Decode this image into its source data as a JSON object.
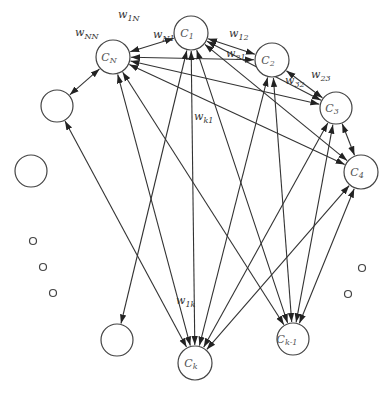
{
  "diagram": {
    "nodes": [
      {
        "id": "C1",
        "label": "C",
        "sub": "1",
        "x": 191,
        "y": 33,
        "r": 17
      },
      {
        "id": "C2",
        "label": "C",
        "sub": "2",
        "x": 272,
        "y": 60,
        "r": 17
      },
      {
        "id": "C3",
        "label": "C",
        "sub": "3",
        "x": 336,
        "y": 108,
        "r": 16
      },
      {
        "id": "C4",
        "label": "C",
        "sub": "4",
        "x": 361,
        "y": 172,
        "r": 17
      },
      {
        "id": "CN",
        "label": "C",
        "sub": "N",
        "x": 113,
        "y": 57,
        "r": 17
      },
      {
        "id": "U1",
        "label": "",
        "sub": "",
        "x": 57,
        "y": 106,
        "r": 16
      },
      {
        "id": "U2",
        "label": "",
        "sub": "",
        "x": 31,
        "y": 171,
        "r": 16
      },
      {
        "id": "U3",
        "label": "",
        "sub": "",
        "x": 117,
        "y": 340,
        "r": 16
      },
      {
        "id": "Ck",
        "label": "C",
        "sub": "k",
        "x": 195,
        "y": 363,
        "r": 17
      },
      {
        "id": "Ck-1",
        "label": "C",
        "sub": "k-1",
        "x": 293,
        "y": 339,
        "r": 16
      }
    ],
    "dots": [
      {
        "x": 33,
        "y": 241,
        "r": 3.5
      },
      {
        "x": 43,
        "y": 267,
        "r": 3.5
      },
      {
        "x": 53,
        "y": 293,
        "r": 3.5
      },
      {
        "x": 362,
        "y": 268,
        "r": 3.5
      },
      {
        "x": 348,
        "y": 294,
        "r": 3.5
      }
    ],
    "edges": [
      {
        "from": "C1",
        "to": "C2",
        "bi": true
      },
      {
        "from": "CN",
        "to": "C1",
        "bi": true
      },
      {
        "from": "CN",
        "to": "C2",
        "bi": true
      },
      {
        "from": "C2",
        "to": "C3",
        "bi": true
      },
      {
        "from": "C1",
        "to": "C3",
        "bi": true
      },
      {
        "from": "C3",
        "to": "C4",
        "bi": true
      },
      {
        "from": "CN",
        "to": "C3",
        "bi": true
      },
      {
        "from": "CN",
        "to": "C4",
        "bi": true
      },
      {
        "from": "C1",
        "to": "C4",
        "bi": true
      },
      {
        "from": "CN",
        "to": "U1",
        "bi": true
      },
      {
        "from": "CN",
        "to": "Ck",
        "bi": true
      },
      {
        "from": "CN",
        "to": "Ck-1",
        "bi": true
      },
      {
        "from": "C1",
        "to": "Ck",
        "bi": true
      },
      {
        "from": "C1",
        "to": "U3",
        "bi": true
      },
      {
        "from": "C1",
        "to": "Ck-1",
        "bi": true
      },
      {
        "from": "C2",
        "to": "Ck",
        "bi": true
      },
      {
        "from": "C2",
        "to": "Ck-1",
        "bi": true
      },
      {
        "from": "C3",
        "to": "Ck",
        "bi": true
      },
      {
        "from": "C3",
        "to": "Ck-1",
        "bi": true
      },
      {
        "from": "C4",
        "to": "Ck",
        "bi": true
      },
      {
        "from": "C4",
        "to": "Ck-1",
        "bi": true
      },
      {
        "from": "U1",
        "to": "Ck",
        "bi": true
      }
    ],
    "weight_labels": [
      {
        "text": "w",
        "sub": "1N",
        "x": 118,
        "y": 18
      },
      {
        "text": "w",
        "sub": "NN",
        "x": 75,
        "y": 36
      },
      {
        "text": "w",
        "sub": "N1",
        "x": 153,
        "y": 38
      },
      {
        "text": "w",
        "sub": "12",
        "x": 229,
        "y": 37
      },
      {
        "text": "w",
        "sub": "21",
        "x": 226,
        "y": 57
      },
      {
        "text": "w",
        "sub": "32",
        "x": 285,
        "y": 84
      },
      {
        "text": "w",
        "sub": "23",
        "x": 311,
        "y": 78
      },
      {
        "text": "w",
        "sub": "k1",
        "x": 194,
        "y": 120
      },
      {
        "text": "w",
        "sub": "1k",
        "x": 176,
        "y": 304
      }
    ]
  }
}
